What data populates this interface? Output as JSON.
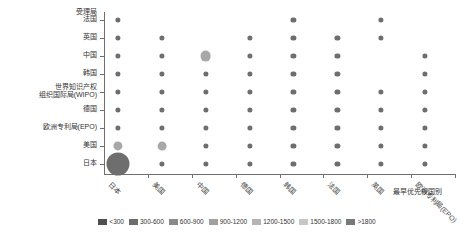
{
  "chart_data": {
    "type": "scatter",
    "title": "",
    "xlabel": "最早优先权国别",
    "ylabel": "受理局",
    "grid": false,
    "legend_position": "bottom",
    "x_categories": [
      "日本",
      "美国",
      "中国",
      "德国",
      "韩国",
      "法国",
      "英国",
      "欧洲专利局(EPO)"
    ],
    "y_categories": [
      "法国",
      "英国",
      "中国",
      "韩国",
      "世界知识产权组织国际局(WIPO)",
      "德国",
      "欧洲专利局(EPO)",
      "美国",
      "日本"
    ],
    "y_categories_display": [
      {
        "lines": [
          "法国"
        ]
      },
      {
        "lines": [
          "英国"
        ]
      },
      {
        "lines": [
          "中国"
        ]
      },
      {
        "lines": [
          "韩国"
        ]
      },
      {
        "lines": [
          "世界知识产权",
          "组织国际局(WIPO)"
        ]
      },
      {
        "lines": [
          "德国"
        ]
      },
      {
        "lines": [
          "欧洲专利局(EPO)"
        ]
      },
      {
        "lines": [
          "美国"
        ]
      },
      {
        "lines": [
          "日本"
        ]
      }
    ],
    "size_legend": {
      "bins": [
        "<300",
        "300-600",
        "600-900",
        "900-1200",
        "1200-1500",
        "1500-1800",
        ">1800"
      ],
      "colors": [
        "#4f4f4f",
        "#6d6d6d",
        "#8a8a8a",
        "#a0a0a0",
        "#b4b4b4",
        "#c6c6c6",
        "#787878"
      ]
    },
    "points": [
      {
        "x": "日本",
        "y": "法国",
        "bin": "<300",
        "color": "#6e6e6e",
        "r": 2.6
      },
      {
        "x": "日本",
        "y": "英国",
        "bin": "<300",
        "color": "#6e6e6e",
        "r": 2.6
      },
      {
        "x": "日本",
        "y": "中国",
        "bin": "<300",
        "color": "#6e6e6e",
        "r": 2.6
      },
      {
        "x": "日本",
        "y": "韩国",
        "bin": "<300",
        "color": "#6e6e6e",
        "r": 2.6
      },
      {
        "x": "日本",
        "y": "世界知识产权组织国际局(WIPO)",
        "bin": "<300",
        "color": "#6e6e6e",
        "r": 2.6
      },
      {
        "x": "日本",
        "y": "德国",
        "bin": "<300",
        "color": "#6e6e6e",
        "r": 2.6
      },
      {
        "x": "日本",
        "y": "欧洲专利局(EPO)",
        "bin": "<300",
        "color": "#6e6e6e",
        "r": 2.6
      },
      {
        "x": "日本",
        "y": "美国",
        "bin": "600-900",
        "color": "#a8a8a8",
        "r": 4.6
      },
      {
        "x": "日本",
        "y": "日本",
        "bin": ">1800",
        "color": "#6e6e6e",
        "r": 11.5
      },
      {
        "x": "美国",
        "y": "英国",
        "bin": "<300",
        "color": "#6e6e6e",
        "r": 2.6
      },
      {
        "x": "美国",
        "y": "中国",
        "bin": "<300",
        "color": "#6e6e6e",
        "r": 2.6
      },
      {
        "x": "美国",
        "y": "韩国",
        "bin": "<300",
        "color": "#6e6e6e",
        "r": 2.6
      },
      {
        "x": "美国",
        "y": "世界知识产权组织国际局(WIPO)",
        "bin": "<300",
        "color": "#6e6e6e",
        "r": 2.6
      },
      {
        "x": "美国",
        "y": "德国",
        "bin": "<300",
        "color": "#6e6e6e",
        "r": 2.6
      },
      {
        "x": "美国",
        "y": "欧洲专利局(EPO)",
        "bin": "<300",
        "color": "#6e6e6e",
        "r": 2.6
      },
      {
        "x": "美国",
        "y": "美国",
        "bin": "600-900",
        "color": "#a8a8a8",
        "r": 4.4
      },
      {
        "x": "美国",
        "y": "日本",
        "bin": "<300",
        "color": "#6e6e6e",
        "r": 2.6
      },
      {
        "x": "中国",
        "y": "中国",
        "bin": "600-900",
        "color": "#a8a8a8",
        "r": 5.4
      },
      {
        "x": "中国",
        "y": "韩国",
        "bin": "<300",
        "color": "#6e6e6e",
        "r": 2.6
      },
      {
        "x": "中国",
        "y": "世界知识产权组织国际局(WIPO)",
        "bin": "<300",
        "color": "#6e6e6e",
        "r": 2.6
      },
      {
        "x": "中国",
        "y": "德国",
        "bin": "<300",
        "color": "#6e6e6e",
        "r": 2.6
      },
      {
        "x": "中国",
        "y": "欧洲专利局(EPO)",
        "bin": "<300",
        "color": "#6e6e6e",
        "r": 2.6
      },
      {
        "x": "中国",
        "y": "美国",
        "bin": "<300",
        "color": "#6e6e6e",
        "r": 2.6
      },
      {
        "x": "中国",
        "y": "日本",
        "bin": "<300",
        "color": "#6e6e6e",
        "r": 2.6
      },
      {
        "x": "德国",
        "y": "英国",
        "bin": "<300",
        "color": "#6e6e6e",
        "r": 2.6
      },
      {
        "x": "德国",
        "y": "中国",
        "bin": "<300",
        "color": "#6e6e6e",
        "r": 2.6
      },
      {
        "x": "德国",
        "y": "韩国",
        "bin": "<300",
        "color": "#6e6e6e",
        "r": 2.6
      },
      {
        "x": "德国",
        "y": "世界知识产权组织国际局(WIPO)",
        "bin": "<300",
        "color": "#6e6e6e",
        "r": 2.6
      },
      {
        "x": "德国",
        "y": "德国",
        "bin": "<300",
        "color": "#6e6e6e",
        "r": 2.6
      },
      {
        "x": "德国",
        "y": "欧洲专利局(EPO)",
        "bin": "<300",
        "color": "#6e6e6e",
        "r": 2.6
      },
      {
        "x": "德国",
        "y": "美国",
        "bin": "<300",
        "color": "#6e6e6e",
        "r": 2.6
      },
      {
        "x": "德国",
        "y": "日本",
        "bin": "<300",
        "color": "#6e6e6e",
        "r": 2.6
      },
      {
        "x": "韩国",
        "y": "法国",
        "bin": "<300",
        "color": "#6e6e6e",
        "r": 2.6
      },
      {
        "x": "韩国",
        "y": "英国",
        "bin": "<300",
        "color": "#6e6e6e",
        "r": 2.6
      },
      {
        "x": "韩国",
        "y": "中国",
        "bin": "<300",
        "color": "#6e6e6e",
        "r": 2.6
      },
      {
        "x": "韩国",
        "y": "韩国",
        "bin": "<300",
        "color": "#6e6e6e",
        "r": 2.6
      },
      {
        "x": "韩国",
        "y": "世界知识产权组织国际局(WIPO)",
        "bin": "<300",
        "color": "#6e6e6e",
        "r": 2.6
      },
      {
        "x": "韩国",
        "y": "德国",
        "bin": "<300",
        "color": "#6e6e6e",
        "r": 2.6
      },
      {
        "x": "韩国",
        "y": "欧洲专利局(EPO)",
        "bin": "<300",
        "color": "#6e6e6e",
        "r": 2.6
      },
      {
        "x": "韩国",
        "y": "美国",
        "bin": "<300",
        "color": "#6e6e6e",
        "r": 2.6
      },
      {
        "x": "韩国",
        "y": "日本",
        "bin": "<300",
        "color": "#6e6e6e",
        "r": 2.6
      },
      {
        "x": "法国",
        "y": "英国",
        "bin": "<300",
        "color": "#6e6e6e",
        "r": 2.6
      },
      {
        "x": "法国",
        "y": "中国",
        "bin": "<300",
        "color": "#6e6e6e",
        "r": 2.6
      },
      {
        "x": "法国",
        "y": "韩国",
        "bin": "<300",
        "color": "#6e6e6e",
        "r": 2.6
      },
      {
        "x": "法国",
        "y": "世界知识产权组织国际局(WIPO)",
        "bin": "<300",
        "color": "#6e6e6e",
        "r": 2.6
      },
      {
        "x": "法国",
        "y": "德国",
        "bin": "<300",
        "color": "#6e6e6e",
        "r": 2.6
      },
      {
        "x": "法国",
        "y": "欧洲专利局(EPO)",
        "bin": "<300",
        "color": "#6e6e6e",
        "r": 2.6
      },
      {
        "x": "法国",
        "y": "美国",
        "bin": "<300",
        "color": "#6e6e6e",
        "r": 2.6
      },
      {
        "x": "法国",
        "y": "日本",
        "bin": "<300",
        "color": "#6e6e6e",
        "r": 2.6
      },
      {
        "x": "英国",
        "y": "法国",
        "bin": "<300",
        "color": "#6e6e6e",
        "r": 2.6
      },
      {
        "x": "英国",
        "y": "英国",
        "bin": "<300",
        "color": "#6e6e6e",
        "r": 2.6
      },
      {
        "x": "英国",
        "y": "世界知识产权组织国际局(WIPO)",
        "bin": "<300",
        "color": "#6e6e6e",
        "r": 2.6
      },
      {
        "x": "英国",
        "y": "德国",
        "bin": "<300",
        "color": "#6e6e6e",
        "r": 2.6
      },
      {
        "x": "英国",
        "y": "欧洲专利局(EPO)",
        "bin": "<300",
        "color": "#6e6e6e",
        "r": 2.6
      },
      {
        "x": "英国",
        "y": "美国",
        "bin": "<300",
        "color": "#6e6e6e",
        "r": 2.6
      },
      {
        "x": "英国",
        "y": "日本",
        "bin": "<300",
        "color": "#6e6e6e",
        "r": 2.6
      },
      {
        "x": "欧洲专利局(EPO)",
        "y": "中国",
        "bin": "<300",
        "color": "#6e6e6e",
        "r": 2.6
      },
      {
        "x": "欧洲专利局(EPO)",
        "y": "韩国",
        "bin": "<300",
        "color": "#6e6e6e",
        "r": 2.6
      },
      {
        "x": "欧洲专利局(EPO)",
        "y": "世界知识产权组织国际局(WIPO)",
        "bin": "<300",
        "color": "#6e6e6e",
        "r": 2.6
      },
      {
        "x": "欧洲专利局(EPO)",
        "y": "德国",
        "bin": "<300",
        "color": "#6e6e6e",
        "r": 2.6
      },
      {
        "x": "欧洲专利局(EPO)",
        "y": "欧洲专利局(EPO)",
        "bin": "<300",
        "color": "#6e6e6e",
        "r": 2.6
      },
      {
        "x": "欧洲专利局(EPO)",
        "y": "美国",
        "bin": "<300",
        "color": "#6e6e6e",
        "r": 2.6
      },
      {
        "x": "欧洲专利局(EPO)",
        "y": "日本",
        "bin": "<300",
        "color": "#6e6e6e",
        "r": 2.6
      }
    ]
  }
}
